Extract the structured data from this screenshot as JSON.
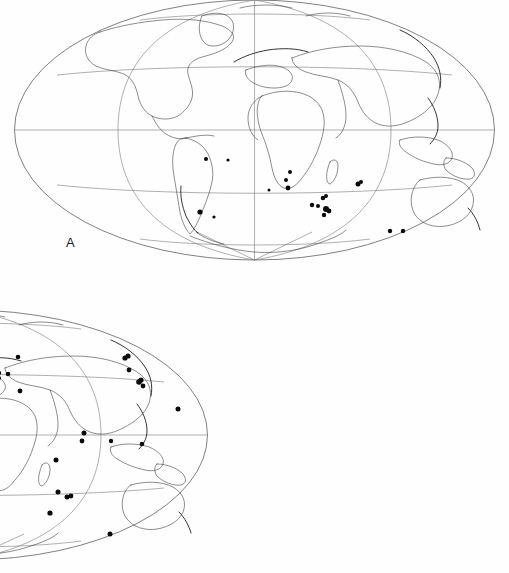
{
  "figure": {
    "kind": "two-panel world distribution map",
    "projection": "Mollweide",
    "background_color": "#ffffff",
    "coastline_color": "#2f2f2f",
    "graticule_color": "#7a7a7a",
    "outline_color": "#4a4a4a",
    "dot_color": "#0a0a0a"
  },
  "panels": [
    {
      "id": "A",
      "label": "A",
      "label_x": 66,
      "label_y": 236,
      "dot_count": 19,
      "map": {
        "cx": 254.5,
        "cy": 130,
        "rx": 240,
        "ry": 130,
        "equator_y": 130,
        "central_meridian_x": 254.5
      }
    },
    {
      "id": "B",
      "label": "B",
      "label_x": 66,
      "label_y": 542,
      "dot_count": 47,
      "map": {
        "cx": 254.5,
        "cy": 435,
        "rx": 240,
        "ry": 125,
        "equator_y": 435,
        "central_meridian_x": 254.5
      }
    }
  ],
  "chart_data": {
    "type": "scatter",
    "title": "",
    "xlabel": "",
    "ylabel": "",
    "projection": "Mollweide",
    "xlim": [
      -180,
      180
    ],
    "ylim": [
      -90,
      90
    ],
    "grid": true,
    "legend": null,
    "annotations": [
      "A",
      "B"
    ],
    "series": [
      {
        "name": "A",
        "panel": "A",
        "marker": "filled-circle",
        "color": "#0a0a0a",
        "points_px": [
          [
            206,
            159,
            2.0
          ],
          [
            290,
            172,
            2.0
          ],
          [
            286,
            180,
            2.0
          ],
          [
            288,
            188,
            2.4
          ],
          [
            200,
            212,
            2.6
          ],
          [
            323,
            198,
            2.3
          ],
          [
            326,
            196,
            2.0
          ],
          [
            318,
            206,
            2.0
          ],
          [
            326,
            209,
            3.0
          ],
          [
            329,
            211,
            2.4
          ],
          [
            324,
            215,
            2.2
          ],
          [
            312,
            205,
            2.2
          ],
          [
            358,
            184,
            2.5
          ],
          [
            361,
            182,
            2.0
          ],
          [
            390,
            231,
            2.2
          ],
          [
            403,
            231,
            2.2
          ],
          [
            228,
            160,
            1.6
          ],
          [
            269,
            190,
            1.5
          ],
          [
            214,
            217,
            1.6
          ]
        ]
      },
      {
        "name": "B",
        "panel": "B",
        "marker": "filled-circle",
        "color": "#0a0a0a",
        "points_px": [
          [
            49,
            381,
            3.0
          ],
          [
            52,
            385,
            2.4
          ],
          [
            118,
            386,
            2.2
          ],
          [
            98,
            400,
            2.0
          ],
          [
            106,
            396,
            2.5
          ],
          [
            107,
            389,
            2.5
          ],
          [
            107,
            382,
            2.5
          ],
          [
            108,
            375,
            2.4
          ],
          [
            110,
            368,
            2.3
          ],
          [
            119,
            365,
            2.3
          ],
          [
            157,
            386,
            2.4
          ],
          [
            142,
            393,
            2.3
          ],
          [
            130,
            397,
            2.2
          ],
          [
            147,
            406,
            2.2
          ],
          [
            124,
            413,
            2.4
          ],
          [
            124,
            430,
            2.6
          ],
          [
            126,
            436,
            2.3
          ],
          [
            125,
            437,
            2.2
          ],
          [
            65,
            473,
            2.2
          ],
          [
            162,
            490,
            2.4
          ],
          [
            207,
            465,
            2.2
          ],
          [
            192,
            495,
            2.0
          ],
          [
            196,
            498,
            2.0
          ],
          [
            278,
            369,
            2.3
          ],
          [
            286,
            373,
            2.2
          ],
          [
            295,
            374,
            2.3
          ],
          [
            305,
            357,
            2.3
          ],
          [
            286,
            378,
            2.0
          ],
          [
            307,
            391,
            2.4
          ],
          [
            371,
            433,
            2.5
          ],
          [
            369,
            441,
            2.4
          ],
          [
            343,
            460,
            2.5
          ],
          [
            345,
            492,
            2.5
          ],
          [
            284,
            490,
            2.3
          ],
          [
            354,
            497,
            2.5
          ],
          [
            358,
            496,
            2.4
          ],
          [
            337,
            513,
            2.6
          ],
          [
            397,
            534,
            2.5
          ],
          [
            412,
            358,
            2.6
          ],
          [
            415,
            356,
            2.6
          ],
          [
            416,
            370,
            2.4
          ],
          [
            426,
            382,
            2.8
          ],
          [
            428,
            380,
            2.6
          ],
          [
            430,
            386,
            2.4
          ],
          [
            465,
            409,
            2.5
          ],
          [
            429,
            444,
            2.3
          ],
          [
            398,
            441,
            2.2
          ]
        ]
      }
    ]
  }
}
